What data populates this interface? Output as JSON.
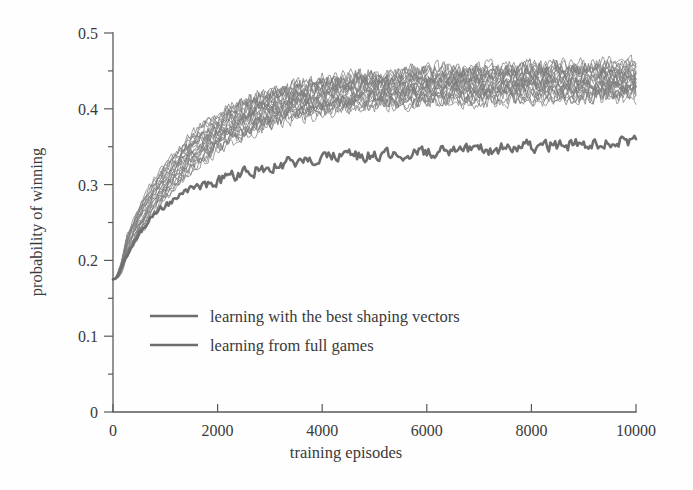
{
  "chart_data": {
    "type": "line",
    "title": "",
    "xlabel": "training episodes",
    "ylabel": "probability of winning",
    "xlim": [
      0,
      10000
    ],
    "ylim": [
      0,
      0.5
    ],
    "xticks": [
      0,
      2000,
      4000,
      6000,
      8000,
      10000
    ],
    "xtick_labels": [
      "0",
      "2000",
      "4000",
      "6000",
      "8000",
      "10000"
    ],
    "yticks": [
      0,
      0.1,
      0.2,
      0.3,
      0.4,
      0.5
    ],
    "ytick_labels": [
      "0",
      "0.1",
      "0.2",
      "0.3",
      "0.4",
      "0.5"
    ],
    "yticks_minor": [
      0.05,
      0.15,
      0.25,
      0.35,
      0.45
    ],
    "grid": false,
    "legend_position": "center-left",
    "legend": [
      "learning with the best shaping vectors",
      "learning from full games"
    ],
    "colors": {
      "thin_lines": "#7d7d7d",
      "thick_line": "#6e6e6e",
      "axis": "#5a5a5a",
      "text": "#3a3a3a",
      "background": "#fefefe"
    },
    "series": [
      {
        "name": "learning with the best shaping vectors",
        "style": "thin-bundle",
        "runs": 25,
        "description": "bundle of independent runs, noisy, rises from ~0.175 to a plateau band of ~0.41-0.46",
        "x": [
          0,
          250,
          500,
          750,
          1000,
          1250,
          1500,
          1750,
          2000,
          2250,
          2500,
          2750,
          3000,
          3250,
          3500,
          3750,
          4000,
          4250,
          4500,
          4750,
          5000,
          5250,
          5500,
          5750,
          6000,
          6250,
          6500,
          6750,
          7000,
          7250,
          7500,
          7750,
          8000,
          8250,
          8500,
          8750,
          9000,
          9250,
          9500,
          9750,
          10000
        ],
        "mean": [
          0.175,
          0.215,
          0.252,
          0.282,
          0.306,
          0.327,
          0.344,
          0.358,
          0.37,
          0.38,
          0.388,
          0.395,
          0.4,
          0.405,
          0.409,
          0.412,
          0.415,
          0.417,
          0.419,
          0.421,
          0.422,
          0.424,
          0.425,
          0.426,
          0.427,
          0.428,
          0.429,
          0.429,
          0.43,
          0.431,
          0.431,
          0.432,
          0.432,
          0.433,
          0.433,
          0.434,
          0.434,
          0.435,
          0.435,
          0.436,
          0.436
        ],
        "band_low": [
          0.17,
          0.2,
          0.232,
          0.258,
          0.28,
          0.3,
          0.317,
          0.331,
          0.344,
          0.355,
          0.364,
          0.371,
          0.378,
          0.383,
          0.388,
          0.391,
          0.394,
          0.397,
          0.399,
          0.401,
          0.403,
          0.404,
          0.405,
          0.406,
          0.407,
          0.408,
          0.409,
          0.409,
          0.41,
          0.41,
          0.411,
          0.411,
          0.412,
          0.412,
          0.413,
          0.413,
          0.413,
          0.414,
          0.414,
          0.414,
          0.415
        ],
        "band_high": [
          0.18,
          0.23,
          0.272,
          0.303,
          0.327,
          0.348,
          0.366,
          0.381,
          0.393,
          0.403,
          0.412,
          0.419,
          0.425,
          0.43,
          0.434,
          0.437,
          0.44,
          0.443,
          0.445,
          0.447,
          0.448,
          0.45,
          0.451,
          0.452,
          0.453,
          0.454,
          0.455,
          0.455,
          0.456,
          0.456,
          0.457,
          0.457,
          0.458,
          0.458,
          0.459,
          0.459,
          0.459,
          0.46,
          0.46,
          0.46,
          0.461
        ]
      },
      {
        "name": "learning from full games",
        "style": "thick-single",
        "runs": 1,
        "description": "single noisy curve rising from ~0.175 to a plateau around 0.34-0.36",
        "x": [
          0,
          250,
          500,
          750,
          1000,
          1250,
          1500,
          1750,
          2000,
          2250,
          2500,
          2750,
          3000,
          3250,
          3500,
          3750,
          4000,
          4250,
          4500,
          4750,
          5000,
          5250,
          5500,
          5750,
          6000,
          6250,
          6500,
          6750,
          7000,
          7250,
          7500,
          7750,
          8000,
          8250,
          8500,
          8750,
          9000,
          9250,
          9500,
          9750,
          10000
        ],
        "y": [
          0.175,
          0.205,
          0.235,
          0.258,
          0.272,
          0.283,
          0.292,
          0.299,
          0.305,
          0.311,
          0.316,
          0.32,
          0.324,
          0.327,
          0.33,
          0.332,
          0.334,
          0.336,
          0.337,
          0.338,
          0.339,
          0.34,
          0.341,
          0.341,
          0.342,
          0.343,
          0.343,
          0.344,
          0.345,
          0.347,
          0.349,
          0.35,
          0.351,
          0.352,
          0.352,
          0.353,
          0.354,
          0.355,
          0.356,
          0.357,
          0.358
        ]
      }
    ]
  }
}
